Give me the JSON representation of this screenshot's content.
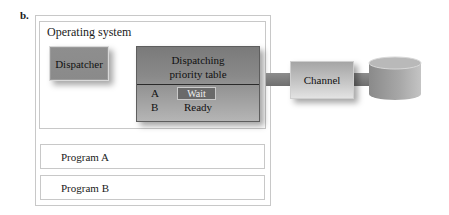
{
  "figure": {
    "label": "b."
  },
  "operating_system": {
    "title": "Operating system",
    "dispatcher": {
      "label": "Dispatcher"
    },
    "priority_table": {
      "title_line1": "Dispatching",
      "title_line2": "priority table",
      "rows": [
        {
          "program": "A",
          "state": "Wait",
          "highlighted": true
        },
        {
          "program": "B",
          "state": "Ready",
          "highlighted": false
        }
      ]
    }
  },
  "channel": {
    "label": "Channel"
  },
  "storage": {
    "icon": "disk-cylinder-icon"
  },
  "programs": [
    {
      "label": "Program A"
    },
    {
      "label": "Program B"
    }
  ],
  "colors": {
    "box_gray": "#8e8e8e",
    "table_gray": "#7a7a7a",
    "wait_highlight": "#6a6a6a",
    "border": "#c8c8c8"
  }
}
